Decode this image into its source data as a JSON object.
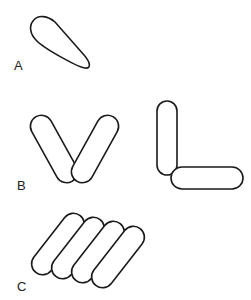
{
  "figure": {
    "panels": [
      {
        "id": "A",
        "label": "A",
        "description": "single cell (club/teardrop shaped rod)"
      },
      {
        "id": "B",
        "label": "B",
        "description": "two rods joined at one end in V and L arrangements"
      },
      {
        "id": "C",
        "label": "C",
        "description": "four rods arranged side by side in a palisade"
      }
    ]
  }
}
